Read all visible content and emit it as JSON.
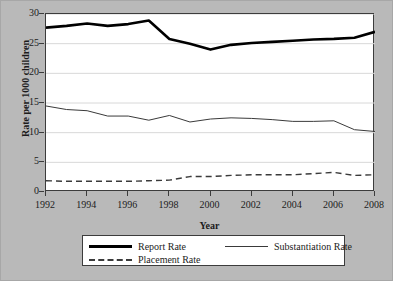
{
  "chart_data": {
    "type": "line",
    "title": "",
    "xlabel": "Year",
    "ylabel": "Rate per 1000 children",
    "x": [
      1992,
      1993,
      1994,
      1995,
      1996,
      1997,
      1998,
      1999,
      2000,
      2001,
      2002,
      2003,
      2004,
      2005,
      2006,
      2007,
      2008
    ],
    "xlim": [
      1992,
      2008
    ],
    "ylim": [
      0,
      30
    ],
    "xticks": [
      1992,
      1994,
      1996,
      1998,
      2000,
      2002,
      2004,
      2006,
      2008
    ],
    "yticks": [
      0,
      5,
      10,
      15,
      20,
      25,
      30
    ],
    "grid": "horizontal",
    "legend_position": "below-axes",
    "series": [
      {
        "name": "Report Rate",
        "style": "solid-thick",
        "color": "#000000",
        "values": [
          27.7,
          28.0,
          28.4,
          28.0,
          28.3,
          28.9,
          25.8,
          25.0,
          24.0,
          24.8,
          25.1,
          25.3,
          25.5,
          25.7,
          25.8,
          26.0,
          27.0
        ]
      },
      {
        "name": "Substantiation Rate",
        "style": "solid-thin",
        "color": "#3a3a3a",
        "values": [
          14.5,
          13.9,
          13.7,
          12.8,
          12.8,
          12.1,
          12.9,
          11.8,
          12.3,
          12.5,
          12.4,
          12.2,
          11.9,
          11.9,
          12.0,
          10.5,
          10.2
        ]
      },
      {
        "name": "Placement Rate",
        "style": "dashed",
        "color": "#3a3a3a",
        "values": [
          1.9,
          1.8,
          1.8,
          1.8,
          1.8,
          1.9,
          2.0,
          2.6,
          2.6,
          2.8,
          2.9,
          2.9,
          2.9,
          3.1,
          3.3,
          2.8,
          2.9
        ]
      }
    ]
  },
  "colors": {
    "background": "#b9b9b9",
    "plot_background": "#ffffff",
    "axis": "#3c3c3c",
    "gridline": "#d8d8d8",
    "report": "#000000",
    "substantiation": "#3a3a3a",
    "placement": "#3a3a3a"
  },
  "legend": {
    "items": [
      {
        "label": "Report Rate"
      },
      {
        "label": "Substantiation Rate"
      },
      {
        "label": "Placement Rate"
      }
    ]
  }
}
